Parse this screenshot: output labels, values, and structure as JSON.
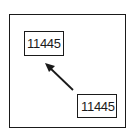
{
  "diagram": {
    "labels": [
      {
        "id": "source-label",
        "text": "11445"
      },
      {
        "id": "target-label",
        "text": "11445"
      }
    ],
    "arrow": {
      "from": "bottom-right-box",
      "to": "top-left-box",
      "direction": "up-left"
    },
    "colors": {
      "stroke": "#1a1a1a",
      "background": "#ffffff"
    }
  }
}
